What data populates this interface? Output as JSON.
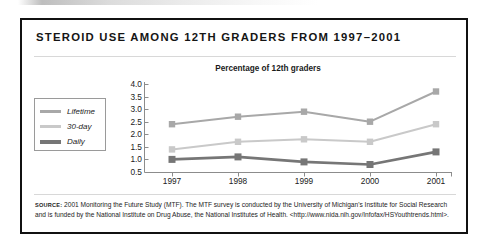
{
  "figure": {
    "title": "STEROID USE AMONG 12TH GRADERS FROM 1997–2001",
    "source_label": "source:",
    "source_text": "2001 Monitoring the Future Study (MTF). The MTF survey is conducted by the University of Michigan's Institute for Social Research and is funded by the National Institute on Drug Abuse, the National Institutes of Health. <http://www.nida.nih.gov/Infofax/HSYouthtrends.html>."
  },
  "chart_data": {
    "type": "line",
    "title": "Percentage of 12th graders",
    "xlabel": "",
    "ylabel": "",
    "categories": [
      "1997",
      "1998",
      "1999",
      "2000",
      "2001"
    ],
    "x": [
      1997,
      1998,
      1999,
      2000,
      2001
    ],
    "ylim": [
      0.5,
      4.0
    ],
    "yticks": [
      "4.0",
      "3.5",
      "3.0",
      "2.5",
      "2.0",
      "1.5",
      "1.0",
      "0.5"
    ],
    "ytick_values": [
      4.0,
      3.5,
      3.0,
      2.5,
      2.0,
      1.5,
      1.0,
      0.5
    ],
    "grid": false,
    "legend_position": "left-outside",
    "markers": "square",
    "series": [
      {
        "name": "Lifetime",
        "values": [
          2.4,
          2.7,
          2.9,
          2.5,
          3.7
        ],
        "color": "#a8a8a8"
      },
      {
        "name": "30-day",
        "values": [
          1.4,
          1.7,
          1.8,
          1.7,
          2.4
        ],
        "color": "#c9c9c9"
      },
      {
        "name": "Daily",
        "values": [
          1.0,
          1.1,
          0.9,
          0.8,
          1.3
        ],
        "color": "#767676"
      }
    ]
  },
  "colors": {
    "frame": "#111111",
    "axis": "#8c8c8c",
    "lifetime": "#a8a8a8",
    "thirty_day": "#c9c9c9",
    "daily": "#767676"
  }
}
